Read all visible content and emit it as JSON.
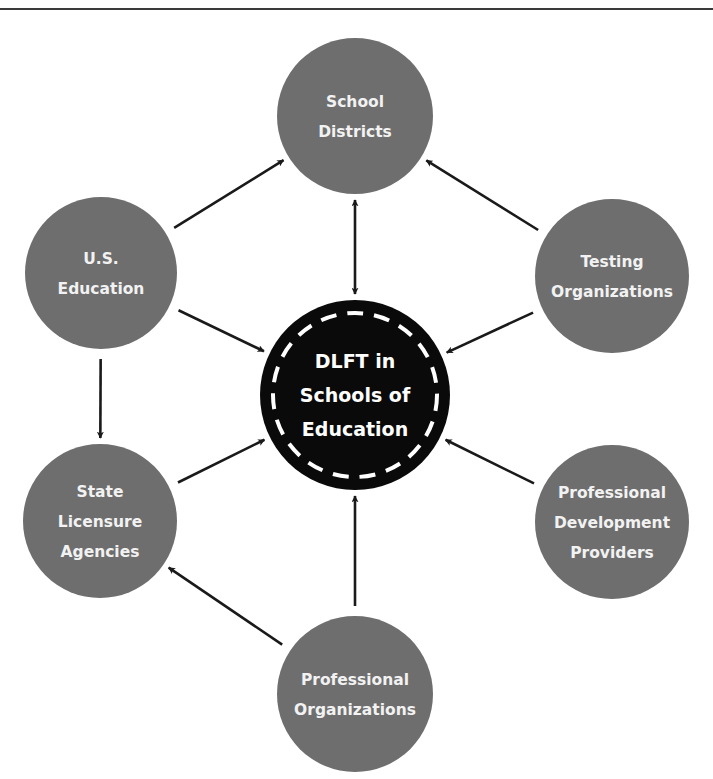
{
  "diagram": {
    "center": {
      "id": "dlft",
      "lines": [
        "DLFT in",
        "Schools of",
        "Education"
      ],
      "fill": "#0a0a0a",
      "dash_color": "#ffffff"
    },
    "nodes": [
      {
        "id": "school-districts",
        "lines": [
          "School",
          "Districts"
        ]
      },
      {
        "id": "us-education",
        "lines": [
          "U.S.",
          "Education"
        ]
      },
      {
        "id": "testing-organizations",
        "lines": [
          "Testing",
          "Organizations"
        ]
      },
      {
        "id": "state-licensure-agencies",
        "lines": [
          "State",
          "Licensure",
          "Agencies"
        ]
      },
      {
        "id": "professional-development-providers",
        "lines": [
          "Professional",
          "Development",
          "Providers"
        ]
      },
      {
        "id": "professional-organizations",
        "lines": [
          "Professional",
          "Organizations"
        ]
      }
    ],
    "edges": [
      {
        "from": "us-education",
        "to": "school-districts",
        "bidirectional": false
      },
      {
        "from": "testing-organizations",
        "to": "school-districts",
        "bidirectional": false
      },
      {
        "from": "school-districts",
        "to": "dlft",
        "bidirectional": true
      },
      {
        "from": "us-education",
        "to": "dlft",
        "bidirectional": false
      },
      {
        "from": "testing-organizations",
        "to": "dlft",
        "bidirectional": false
      },
      {
        "from": "us-education",
        "to": "state-licensure-agencies",
        "bidirectional": false
      },
      {
        "from": "state-licensure-agencies",
        "to": "dlft",
        "bidirectional": false
      },
      {
        "from": "professional-development-providers",
        "to": "dlft",
        "bidirectional": false
      },
      {
        "from": "professional-organizations",
        "to": "dlft",
        "bidirectional": false
      },
      {
        "from": "professional-organizations",
        "to": "state-licensure-agencies",
        "bidirectional": false
      }
    ],
    "colors": {
      "node_fill": "#6e6e6e",
      "node_text": "#f2f2f2",
      "arrow": "#1a1a1a"
    }
  }
}
